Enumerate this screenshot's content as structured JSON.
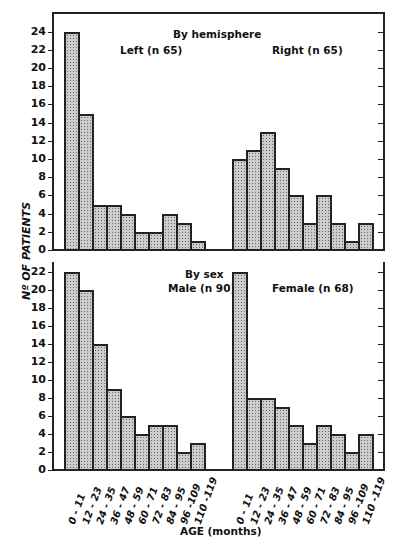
{
  "chart_data": [
    {
      "type": "bar",
      "title": "By hemisphere",
      "categories": [
        "0-11",
        "12-23",
        "24-35",
        "36-47",
        "48-59",
        "60-71",
        "72-83",
        "84-95",
        "96-109",
        "110-119"
      ],
      "series": [
        {
          "name": "Left (n 65)",
          "values": [
            24,
            15,
            5,
            5,
            4,
            2,
            2,
            4,
            3,
            1
          ]
        },
        {
          "name": "Right (n 65)",
          "values": [
            10,
            11,
            13,
            9,
            6,
            3,
            6,
            3,
            1,
            3
          ]
        }
      ],
      "xlabel": "AGE (months)",
      "ylabel": "Nº OF PATIENTS",
      "yticks": [
        0,
        2,
        4,
        6,
        8,
        10,
        12,
        14,
        16,
        18,
        20,
        22,
        24
      ],
      "ylim": [
        0,
        24
      ]
    },
    {
      "type": "bar",
      "title": "By sex",
      "categories": [
        "0-11",
        "12-23",
        "24-35",
        "36-47",
        "48-59",
        "60-71",
        "72-83",
        "84-95",
        "96-109",
        "110-119"
      ],
      "series": [
        {
          "name": "Male (n 90)",
          "values": [
            22,
            20,
            14,
            9,
            6,
            4,
            5,
            5,
            2,
            3
          ]
        },
        {
          "name": "Female (n 68)",
          "values": [
            22,
            8,
            8,
            7,
            5,
            3,
            5,
            4,
            2,
            4
          ]
        }
      ],
      "xlabel": "AGE (months)",
      "ylabel": "Nº OF PATIENTS",
      "yticks": [
        0,
        2,
        4,
        6,
        8,
        10,
        12,
        14,
        16,
        18,
        20,
        22
      ],
      "ylim": [
        0,
        22
      ]
    }
  ],
  "labels": {
    "top_title": "By hemisphere",
    "top_left": "Left (n 65)",
    "top_right": "Right (n 65)",
    "bot_title": "By sex",
    "bot_left": "Male (n 90)",
    "bot_right": "Female (n 68)",
    "ylabel": "Nº OF PATIENTS",
    "xlabel": "AGE (months)"
  },
  "xticks": [
    "0 - 11",
    "12 - 23",
    "24 - 35",
    "36 - 47",
    "48 - 59",
    "60 - 71",
    "72 - 83",
    "84 - 95",
    "96 -109",
    "110 -119"
  ]
}
